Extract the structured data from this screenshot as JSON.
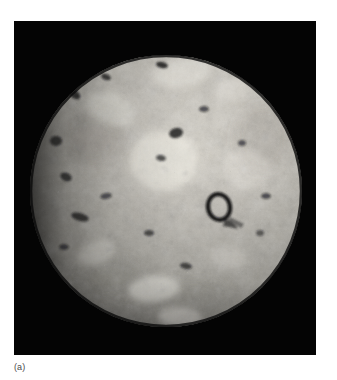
{
  "figure": {
    "caption": "(a)",
    "image_kind": "grayscale spacecraft photograph of a planetary body",
    "background_color": "#ffffff",
    "plate_color": "#040404",
    "plate": {
      "x": 14,
      "y": 21,
      "width": 302,
      "height": 334
    },
    "disk": {
      "center_x": 152,
      "center_y": 170,
      "radius": 136,
      "body_color": "#b9b6ae",
      "highlight_color": "#efece4",
      "shadow_color": "#1b1b1b",
      "limb_color": "#2a2a28"
    },
    "surface": {
      "bright_patch_color": "#f2f0e8",
      "mid_tone_color": "#a9a69e",
      "dark_spot_color": "#17171a",
      "speckle_color": "#d8d5cc"
    },
    "features": {
      "dark_spots": [
        {
          "name": "upper-right-dark-patera",
          "cx": 254,
          "cy": 62,
          "rx": 13,
          "ry": 9,
          "rot": -28,
          "opacity": 0.95
        },
        {
          "name": "north-elongated-patera",
          "cx": 113,
          "cy": 33,
          "rx": 11,
          "ry": 4,
          "rot": -8,
          "opacity": 0.9
        },
        {
          "name": "north-small-patera-a",
          "cx": 148,
          "cy": 44,
          "rx": 6,
          "ry": 3,
          "rot": 12,
          "opacity": 0.85
        },
        {
          "name": "north-small-patera-b",
          "cx": 186,
          "cy": 30,
          "rx": 5,
          "ry": 3,
          "rot": -20,
          "opacity": 0.8
        },
        {
          "name": "north-small-patera-c",
          "cx": 92,
          "cy": 56,
          "rx": 5,
          "ry": 3,
          "rot": 20,
          "opacity": 0.78
        },
        {
          "name": "northwest-patera",
          "cx": 60,
          "cy": 73,
          "rx": 7,
          "ry": 4,
          "rot": 35,
          "opacity": 0.8
        },
        {
          "name": "west-limb-patera-a",
          "cx": 42,
          "cy": 120,
          "rx": 6,
          "ry": 5,
          "rot": 0,
          "opacity": 0.72
        },
        {
          "name": "west-limb-patera-b",
          "cx": 52,
          "cy": 156,
          "rx": 6,
          "ry": 4,
          "rot": 25,
          "opacity": 0.74
        },
        {
          "name": "west-limb-patera-c",
          "cx": 66,
          "cy": 196,
          "rx": 9,
          "ry": 4,
          "rot": 15,
          "opacity": 0.76
        },
        {
          "name": "west-limb-patera-d",
          "cx": 50,
          "cy": 226,
          "rx": 5,
          "ry": 3,
          "rot": 0,
          "opacity": 0.6
        },
        {
          "name": "central-patera-a",
          "cx": 162,
          "cy": 112,
          "rx": 7,
          "ry": 5,
          "rot": -15,
          "opacity": 0.82
        },
        {
          "name": "central-patera-b",
          "cx": 147,
          "cy": 137,
          "rx": 5,
          "ry": 3,
          "rot": 10,
          "opacity": 0.7
        },
        {
          "name": "central-patera-c",
          "cx": 190,
          "cy": 88,
          "rx": 5,
          "ry": 3,
          "rot": 0,
          "opacity": 0.65
        },
        {
          "name": "south-central-patera",
          "cx": 135,
          "cy": 212,
          "rx": 5,
          "ry": 3,
          "rot": 0,
          "opacity": 0.68
        },
        {
          "name": "south-patera-a",
          "cx": 172,
          "cy": 245,
          "rx": 6,
          "ry": 3,
          "rot": 10,
          "opacity": 0.7
        },
        {
          "name": "southwest-patera",
          "cx": 92,
          "cy": 175,
          "rx": 6,
          "ry": 3,
          "rot": -10,
          "opacity": 0.6
        },
        {
          "name": "east-patera-a",
          "cx": 252,
          "cy": 175,
          "rx": 5,
          "ry": 3,
          "rot": 0,
          "opacity": 0.65
        },
        {
          "name": "east-patera-b",
          "cx": 228,
          "cy": 122,
          "rx": 4,
          "ry": 3,
          "rot": 0,
          "opacity": 0.6
        },
        {
          "name": "east-patera-c",
          "cx": 246,
          "cy": 212,
          "rx": 4,
          "ry": 3,
          "rot": 0,
          "opacity": 0.55
        }
      ],
      "ring_caldera": {
        "name": "ring-caldera",
        "cx": 205,
        "cy": 186,
        "rx": 11,
        "ry": 13,
        "rot": -12,
        "stroke_width": 4
      },
      "bright_patches": [
        {
          "name": "bright-patch-center",
          "cx": 150,
          "cy": 140,
          "rx": 34,
          "ry": 30,
          "rot": 0,
          "opacity": 0.55
        },
        {
          "name": "bright-patch-north",
          "cx": 168,
          "cy": 52,
          "rx": 30,
          "ry": 14,
          "rot": -10,
          "opacity": 0.4
        },
        {
          "name": "bright-patch-northwest",
          "cx": 96,
          "cy": 88,
          "rx": 24,
          "ry": 16,
          "rot": 20,
          "opacity": 0.35
        },
        {
          "name": "bright-patch-south-a",
          "cx": 140,
          "cy": 268,
          "rx": 26,
          "ry": 13,
          "rot": -6,
          "opacity": 0.6
        },
        {
          "name": "bright-patch-south-b",
          "cx": 166,
          "cy": 296,
          "rx": 22,
          "ry": 10,
          "rot": 4,
          "opacity": 0.55
        },
        {
          "name": "bright-patch-southwest",
          "cx": 82,
          "cy": 232,
          "rx": 20,
          "ry": 12,
          "rot": -18,
          "opacity": 0.4
        },
        {
          "name": "bright-patch-east",
          "cx": 232,
          "cy": 148,
          "rx": 24,
          "ry": 20,
          "rot": 0,
          "opacity": 0.3
        },
        {
          "name": "bright-patch-northeast",
          "cx": 218,
          "cy": 70,
          "rx": 18,
          "ry": 12,
          "rot": -25,
          "opacity": 0.3
        },
        {
          "name": "bright-patch-southeast",
          "cx": 214,
          "cy": 236,
          "rx": 18,
          "ry": 11,
          "rot": 10,
          "opacity": 0.3
        }
      ],
      "dark_regions": [
        {
          "name": "dark-region-northwest",
          "cx": 78,
          "cy": 118,
          "rx": 32,
          "ry": 26,
          "rot": 0,
          "opacity": 0.22
        },
        {
          "name": "dark-region-southwest",
          "cx": 96,
          "cy": 256,
          "rx": 34,
          "ry": 22,
          "rot": 0,
          "opacity": 0.18
        },
        {
          "name": "dark-region-south",
          "cx": 180,
          "cy": 280,
          "rx": 40,
          "ry": 22,
          "rot": 0,
          "opacity": 0.15
        },
        {
          "name": "dark-region-east",
          "cx": 248,
          "cy": 118,
          "rx": 28,
          "ry": 34,
          "rot": 0,
          "opacity": 0.16
        }
      ]
    }
  }
}
